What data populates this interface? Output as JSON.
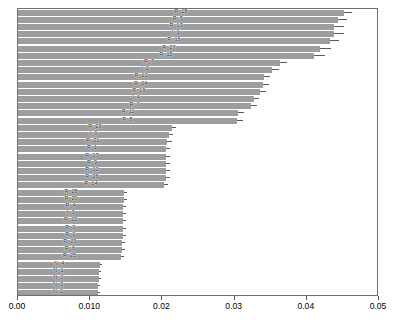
{
  "chart_data": {
    "type": "bar",
    "orientation": "horizontal",
    "title": "",
    "xlabel": "",
    "ylabel": "",
    "xlim": [
      0.0,
      0.05
    ],
    "grid": false,
    "legend": false,
    "tick_labels": [
      "0.00",
      "0.010",
      "0.02",
      "0.03",
      "0.04",
      "0.05"
    ],
    "tick_values": [
      0.0,
      0.01,
      0.02,
      0.03,
      0.04,
      0.05
    ],
    "categories": [
      "R_18",
      "R_5",
      "R_13",
      "I_1",
      "R_16",
      "R_27",
      "R_15",
      "R_7",
      "I_2",
      "R_12",
      "R_24",
      "R_19",
      "I_4",
      "R_0",
      "R_11",
      "R_8",
      "R_23",
      "I_0",
      "R_21",
      "R_1",
      "R_17",
      "R_9",
      "R_10",
      "R_26",
      "R_14",
      "R_28",
      "R_20",
      "R_4",
      "I_3",
      "R_22",
      "R_3",
      "R_2",
      "R_29",
      "R_6",
      "R_25",
      "N_4",
      "N_1",
      "N_0",
      "N_3",
      "N_2"
    ],
    "values": [
      0.0451,
      0.0443,
      0.0438,
      0.0437,
      0.0432,
      0.0418,
      0.041,
      0.0363,
      0.0352,
      0.0341,
      0.034,
      0.0335,
      0.0327,
      0.0323,
      0.0305,
      0.0303,
      0.0213,
      0.0209,
      0.0207,
      0.0205,
      0.0205,
      0.0205,
      0.0205,
      0.0205,
      0.0202,
      0.0147,
      0.0147,
      0.0146,
      0.0146,
      0.0146,
      0.0145,
      0.0145,
      0.0144,
      0.0144,
      0.0143,
      0.0114,
      0.0112,
      0.0112,
      0.0111,
      0.0111
    ],
    "whisker_high": [
      0.0463,
      0.0456,
      0.0452,
      0.0452,
      0.0445,
      0.0434,
      0.0425,
      0.0373,
      0.0361,
      0.0349,
      0.0348,
      0.0343,
      0.0334,
      0.0331,
      0.0313,
      0.0311,
      0.0219,
      0.0215,
      0.0213,
      0.0211,
      0.0211,
      0.0211,
      0.0211,
      0.0211,
      0.0208,
      0.0151,
      0.0151,
      0.015,
      0.015,
      0.015,
      0.0149,
      0.0149,
      0.0148,
      0.0148,
      0.0147,
      0.0117,
      0.0115,
      0.0115,
      0.0114,
      0.0114
    ]
  }
}
